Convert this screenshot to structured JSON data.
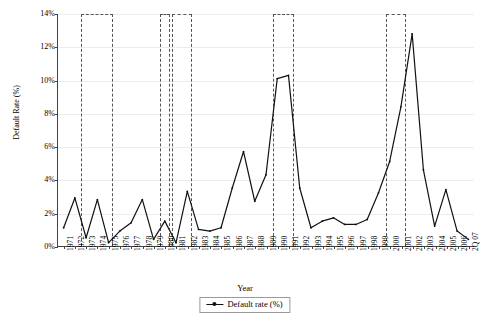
{
  "chart_data": {
    "type": "line",
    "title": "",
    "xlabel": "Year",
    "ylabel": "Default Rate (%)",
    "ylim": [
      0,
      14
    ],
    "yticks": [
      "0%",
      "2%",
      "4%",
      "6%",
      "8%",
      "10%",
      "12%",
      "14%"
    ],
    "ytick_values": [
      0,
      2,
      4,
      6,
      8,
      10,
      12,
      14
    ],
    "grid": true,
    "legend_position": "bottom-center",
    "legend": [
      "Default rate (%)"
    ],
    "marker": "line-with-dot",
    "series_color": "#111111",
    "recession_band_color": "#555555",
    "categories": [
      "1971",
      "1972",
      "1973",
      "1974",
      "1975",
      "1976",
      "1977",
      "1978",
      "1979",
      "1980",
      "1981",
      "1982",
      "1983",
      "1984",
      "1985",
      "1986",
      "1987",
      "1988",
      "1989",
      "1990",
      "1991",
      "1992",
      "1993",
      "1994",
      "1995",
      "1996",
      "1997",
      "1998",
      "1999",
      "2000",
      "2001",
      "2002",
      "2003",
      "2004",
      "2005",
      "2006",
      "2Q 07"
    ],
    "series": [
      {
        "name": "Default rate (%)",
        "values": [
          1.1,
          2.9,
          0.5,
          2.8,
          0.2,
          0.9,
          1.4,
          2.8,
          0.4,
          1.5,
          0.2,
          3.3,
          1.0,
          0.9,
          1.1,
          3.5,
          5.7,
          2.7,
          4.3,
          10.1,
          10.3,
          3.5,
          1.1,
          1.5,
          1.7,
          1.3,
          1.3,
          1.6,
          3.2,
          5.1,
          8.4,
          12.8,
          4.6,
          1.2,
          3.4,
          0.9,
          0.4
        ]
      }
    ],
    "recession_bands": [
      {
        "start": "1973",
        "end": "1975"
      },
      {
        "start": "1980",
        "end": "1980"
      },
      {
        "start": "1981",
        "end": "1982"
      },
      {
        "start": "1990",
        "end": "1991"
      },
      {
        "start": "2000",
        "end": "2001"
      }
    ]
  }
}
